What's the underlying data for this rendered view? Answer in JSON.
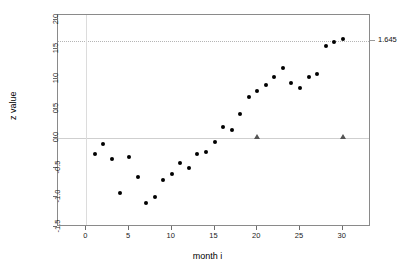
{
  "chart_data": {
    "type": "scatter",
    "title": "",
    "xlabel": "month i",
    "ylabel": "z value",
    "xlim": [
      -3.3,
      33.3
    ],
    "ylim": [
      -1.5,
      2.08
    ],
    "xticks": [
      0,
      5,
      10,
      15,
      20,
      25,
      30
    ],
    "xtick_labels": [
      "0",
      "5",
      "10",
      "15",
      "20",
      "25",
      "30"
    ],
    "yticks": [
      -1.5,
      -1.0,
      -0.5,
      0.0,
      0.5,
      1.0,
      1.5,
      2.0
    ],
    "ytick_labels": [
      "-1.5",
      "-1.0",
      "-0.5",
      "0.0",
      "0.5",
      "1.0",
      "1.5",
      "2.0"
    ],
    "grid": false,
    "legend": "none",
    "series": [
      {
        "name": "z value",
        "marker": "filled-circle",
        "color": "#000000",
        "x": [
          1,
          2,
          3,
          4,
          5,
          6,
          7,
          8,
          9,
          10,
          11,
          12,
          13,
          14,
          15,
          16,
          17,
          18,
          19,
          20,
          21,
          22,
          23,
          24,
          25,
          26,
          27,
          28,
          29,
          30
        ],
        "y": [
          -0.26,
          -0.1,
          -0.36,
          -0.92,
          -0.31,
          -0.66,
          -1.1,
          -1.0,
          -0.71,
          -0.61,
          -0.42,
          -0.51,
          -0.26,
          -0.24,
          -0.07,
          0.19,
          0.14,
          0.4,
          0.7,
          0.8,
          0.89,
          1.03,
          1.19,
          0.94,
          0.84,
          1.03,
          1.08,
          1.56,
          1.63,
          1.68
        ]
      },
      {
        "name": "reference markers",
        "marker": "filled-triangle",
        "color": "#555555",
        "x": [
          20,
          30
        ],
        "y": [
          0.0,
          0.0
        ]
      }
    ],
    "reference_lines": [
      {
        "name": "zero-line",
        "orientation": "horizontal",
        "value": 0.0,
        "style": "solid",
        "color": "#cfcfcf"
      },
      {
        "name": "critical-value-line",
        "orientation": "horizontal",
        "value": 1.645,
        "style": "dotted",
        "color": "#b5b5b5",
        "label": "1.645"
      },
      {
        "name": "origin-line",
        "orientation": "vertical",
        "value": 0,
        "style": "solid",
        "color": "#dcdcdc"
      }
    ],
    "annotations": [
      {
        "name": "critical-value-label",
        "text": "1.645",
        "x": 30,
        "y": 1.645,
        "position": "right-outside"
      }
    ]
  }
}
